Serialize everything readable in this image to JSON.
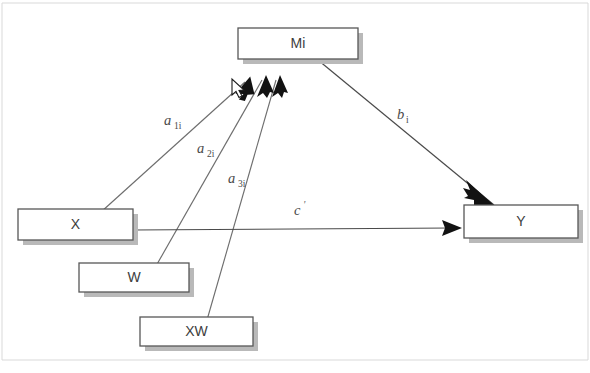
{
  "diagram": {
    "background_color": "#ffffff",
    "box_border_color": "#575757",
    "box_fill_color": "#ffffff",
    "box_shadow_color": "#b9b9b9",
    "line_color": "#6e6e6e",
    "arrow_color": "#121212",
    "label_color": "#3d3d3d",
    "nodes": [
      {
        "id": "mi",
        "label": "Mi",
        "x": 238,
        "y": 28,
        "width": 120,
        "height": 31
      },
      {
        "id": "x",
        "label": "X",
        "x": 18,
        "y": 209,
        "width": 115,
        "height": 31
      },
      {
        "id": "w",
        "label": "W",
        "x": 79,
        "y": 263,
        "width": 110,
        "height": 29
      },
      {
        "id": "xw",
        "label": "XW",
        "x": 140,
        "y": 317,
        "width": 113,
        "height": 29
      },
      {
        "id": "y",
        "label": "Y",
        "x": 464,
        "y": 205,
        "width": 114,
        "height": 33
      }
    ],
    "paths": [
      {
        "id": "a1i",
        "from": "x",
        "to": "mi",
        "label": "a",
        "subscript": "1i",
        "prime": ""
      },
      {
        "id": "a2i",
        "from": "w",
        "to": "mi",
        "label": "a",
        "subscript": "2i",
        "prime": ""
      },
      {
        "id": "a3i",
        "from": "xw",
        "to": "mi",
        "label": "a",
        "subscript": "3i",
        "prime": ""
      },
      {
        "id": "bi",
        "from": "mi",
        "to": "y",
        "label": "b",
        "subscript": "i",
        "prime": ""
      },
      {
        "id": "cprime",
        "from": "x",
        "to": "y",
        "label": "c",
        "subscript": "",
        "prime": "'"
      }
    ],
    "cursor": {
      "name": "mouse-pointer",
      "x": 232,
      "y": 79
    }
  }
}
